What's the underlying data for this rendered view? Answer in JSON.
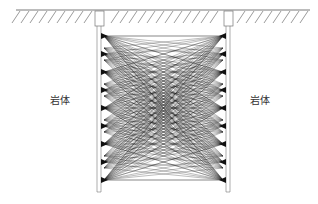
{
  "diagram": {
    "type": "crosshole-tomography-ray-paths",
    "labels": {
      "left_rock": "岩体",
      "right_rock": "岩体"
    },
    "ground": {
      "y": 10,
      "x_start": 16,
      "x_end": 310,
      "hatch_depth": 13
    },
    "boreholes": [
      {
        "name": "left-borehole",
        "x": 99,
        "collar_box": [
          95,
          11,
          9,
          15
        ],
        "bottom_y": 192
      },
      {
        "name": "right-borehole",
        "x": 228,
        "collar_box": [
          224,
          11,
          9,
          15
        ],
        "bottom_y": 192
      }
    ],
    "sources_left_x": 104,
    "sources_right_x": 223,
    "source_y": [
      36,
      54,
      72,
      90,
      108,
      126,
      144,
      162,
      180
    ],
    "receiver_y_start": 36,
    "receiver_y_end": 180,
    "receiver_count": 13,
    "colors": {
      "line": "#222222",
      "ground": "#555555",
      "borehole": "#777777"
    }
  }
}
